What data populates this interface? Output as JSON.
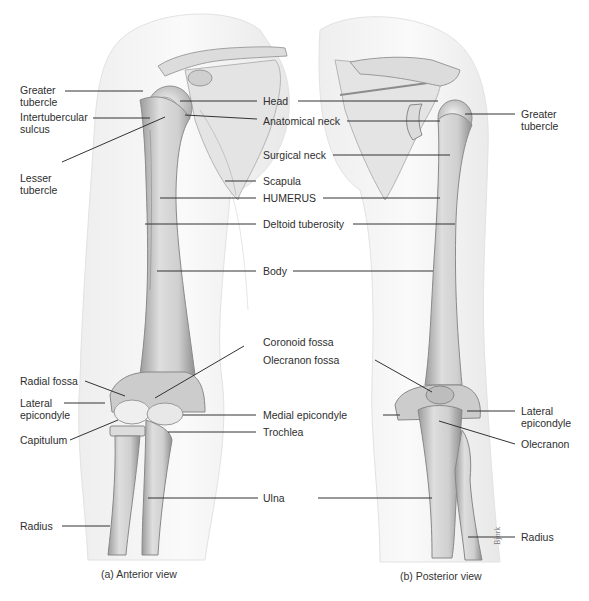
{
  "figure": {
    "panels": [
      {
        "id": "a",
        "caption": "(a) Anterior view"
      },
      {
        "id": "b",
        "caption": "(b) Posterior view"
      }
    ],
    "left_labels": {
      "greater_tubercle": [
        "Greater",
        "tubercle"
      ],
      "intertubercular_sulcus": [
        "Intertubercular",
        "sulcus"
      ],
      "lesser_tubercle": [
        "Lesser",
        "tubercle"
      ],
      "radial_fossa": "Radial fossa",
      "lateral_epicondyle": [
        "Lateral",
        "epicondyle"
      ],
      "capitulum": "Capitulum",
      "radius": "Radius"
    },
    "center_labels": {
      "head": "Head",
      "anatomical_neck": "Anatomical neck",
      "surgical_neck": "Surgical neck",
      "scapula": "Scapula",
      "humerus": "HUMERUS",
      "deltoid_tuberosity": "Deltoid tuberosity",
      "body": "Body",
      "coronoid_fossa": "Coronoid fossa",
      "olecranon_fossa": "Olecranon fossa",
      "medial_epicondyle": "Medial epicondyle",
      "trochlea": "Trochlea",
      "ulna": "Ulna"
    },
    "right_labels": {
      "greater_tubercle": [
        "Greater",
        "tubercle"
      ],
      "lateral_epicondyle": [
        "Lateral",
        "epicondyle"
      ],
      "olecranon": "Olecranon",
      "radius": "Radius"
    },
    "artist_signature": "Bjork",
    "colors": {
      "background": "#ffffff",
      "skin_outline": "#e6e6e6",
      "bone_fill": "#d9d9d9",
      "bone_shade": "#a8a8a8",
      "leader_line": "#333333",
      "text": "#2e2e2e"
    }
  }
}
